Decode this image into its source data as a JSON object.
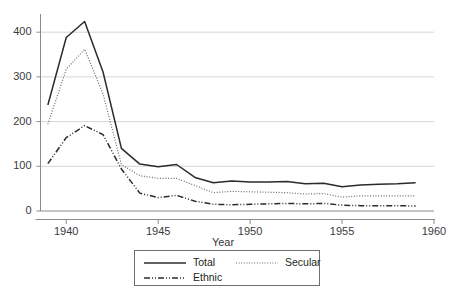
{
  "chart_data": {
    "type": "line",
    "title": "",
    "xlabel": "Year",
    "ylabel": "",
    "xlim": [
      1938.6,
      1960.0
    ],
    "ylim": [
      0,
      440
    ],
    "grid": "horizontal",
    "legend_position": "below-plot",
    "x_ticks": [
      1940,
      1945,
      1950,
      1955,
      1960
    ],
    "x_tick_labels": [
      "1940",
      "1945",
      "1950",
      "1955",
      "1960"
    ],
    "y_ticks": [
      0,
      100,
      200,
      300,
      400
    ],
    "y_tick_labels": [
      "0",
      "100",
      "200",
      "300",
      "400"
    ],
    "x": [
      1939,
      1940,
      1941,
      1942,
      1943,
      1944,
      1945,
      1946,
      1947,
      1948,
      1949,
      1950,
      1951,
      1952,
      1953,
      1954,
      1955,
      1956,
      1957,
      1958,
      1959
    ],
    "series": [
      {
        "name": "Total",
        "style": "solid",
        "color": "#2b2b2b",
        "values": [
          237,
          388,
          424,
          311,
          140,
          105,
          99,
          104,
          75,
          63,
          67,
          65,
          65,
          66,
          61,
          62,
          54,
          58,
          60,
          61,
          63
        ]
      },
      {
        "name": "Secular",
        "style": "dotted",
        "color": "#6b6b6b",
        "values": [
          194,
          317,
          362,
          262,
          104,
          79,
          73,
          73,
          57,
          41,
          44,
          43,
          42,
          41,
          38,
          39,
          31,
          34,
          34,
          34,
          34
        ]
      },
      {
        "name": "Ethnic",
        "style": "dashdotdot",
        "color": "#2b2b2b",
        "values": [
          106,
          164,
          191,
          171,
          94,
          40,
          30,
          35,
          22,
          15,
          14,
          15,
          16,
          17,
          16,
          17,
          13,
          12,
          12,
          12,
          11
        ]
      }
    ]
  },
  "legend": {
    "entries": [
      {
        "label": "Total",
        "style": "solid"
      },
      {
        "label": "Secular",
        "style": "dotted"
      },
      {
        "label": "Ethnic",
        "style": "dashdotdot"
      }
    ]
  },
  "axes": {
    "x_title": "Year"
  },
  "colors": {
    "total": "#2b2b2b",
    "secular": "#6b6b6b",
    "ethnic": "#2b2b2b",
    "gridline": "#d6d6d6",
    "axis": "#8a8a8a",
    "text": "#3a3a3a",
    "background": "#ffffff"
  }
}
